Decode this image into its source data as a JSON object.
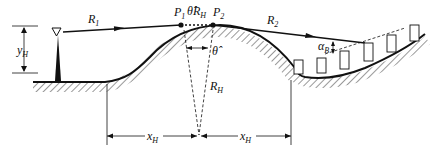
{
  "labels": {
    "R1": {
      "main": "R",
      "sub": "1"
    },
    "R2": {
      "main": "R",
      "sub": "2"
    },
    "P1": {
      "main": "P",
      "sub": "1"
    },
    "P2": {
      "main": "P",
      "sub": "2"
    },
    "thetaRH": {
      "main": "θ̂R",
      "sub": "H"
    },
    "theta": {
      "main": "θ̂"
    },
    "RH": {
      "main": "R",
      "sub": "H"
    },
    "yH": {
      "main": "y",
      "sub": "H"
    },
    "alphaB": {
      "main": "α",
      "sub": "B"
    },
    "xH_left": {
      "main": "x",
      "sub": "H"
    },
    "xH_right": {
      "main": "x",
      "sub": "H"
    }
  },
  "colors": {
    "line": "#111111",
    "hatch": "#333333",
    "background": "#ffffff"
  }
}
